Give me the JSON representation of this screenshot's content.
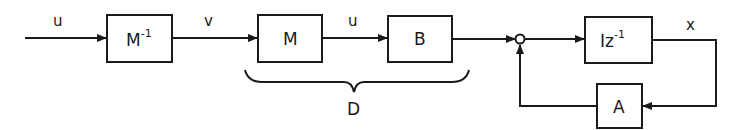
{
  "diagram": {
    "type": "block-diagram",
    "blocks": {
      "m_inverse": {
        "base": "M",
        "superscript": "-1"
      },
      "m": {
        "label": "M"
      },
      "b": {
        "label": "B"
      },
      "delay": {
        "base": "Iz",
        "superscript": "-1"
      },
      "a": {
        "label": "A"
      }
    },
    "signals": {
      "input": "u",
      "after_m_inverse": "v",
      "between_m_b": "u",
      "output": "x"
    },
    "group": {
      "label": "D",
      "spans": [
        "m",
        "b"
      ]
    },
    "summing_junction": {
      "inputs": [
        "B output",
        "A feedback"
      ],
      "output": "Iz^-1 input"
    },
    "connections": [
      {
        "from": "input",
        "to": "m_inverse",
        "signal": "u"
      },
      {
        "from": "m_inverse",
        "to": "m",
        "signal": "v"
      },
      {
        "from": "m",
        "to": "b",
        "signal": "u"
      },
      {
        "from": "b",
        "to": "summing_junction"
      },
      {
        "from": "summing_junction",
        "to": "delay"
      },
      {
        "from": "delay",
        "to": "a",
        "signal": "x"
      },
      {
        "from": "a",
        "to": "summing_junction"
      }
    ]
  }
}
